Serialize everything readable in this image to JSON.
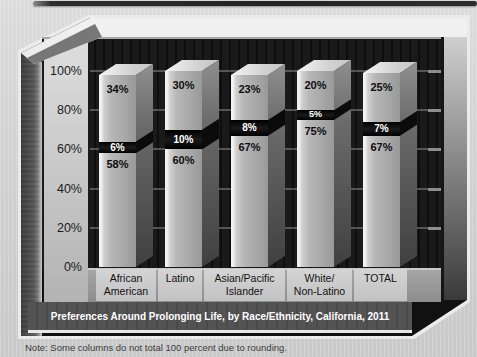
{
  "page": {
    "note": "Note: Some columns do not total 100 percent due to rounding."
  },
  "chart_data": {
    "type": "bar",
    "subtype": "stacked-3d-column",
    "title": "Preferences Around Prolonging Life, by Race/Ethnicity, California, 2011",
    "categories": [
      "African American",
      "Latino",
      "Asian/Pacific Islander",
      "White/Non-Latino",
      "TOTAL"
    ],
    "category_lines": [
      [
        "African",
        "American"
      ],
      [
        "Latino"
      ],
      [
        "Asian/Pacific",
        "Islander"
      ],
      [
        "White/",
        "Non-Latino"
      ],
      [
        "TOTAL"
      ]
    ],
    "y_axis": {
      "ticks": [
        "100%",
        "80%",
        "60%",
        "40%",
        "20%",
        "0%"
      ],
      "lim": [
        0,
        100
      ],
      "grid": true
    },
    "series": [
      {
        "name": "bottom-segment",
        "values": [
          58,
          60,
          67,
          75,
          67
        ]
      },
      {
        "name": "middle-segment",
        "values": [
          6,
          10,
          8,
          5,
          7
        ]
      },
      {
        "name": "top-segment",
        "values": [
          34,
          30,
          23,
          20,
          25
        ]
      }
    ],
    "bars": [
      {
        "category": "African American",
        "top": {
          "value": 34,
          "label": "34%"
        },
        "middle": {
          "value": 6,
          "label": "6%"
        },
        "bottom": {
          "value": 58,
          "label": "58%"
        }
      },
      {
        "category": "Latino",
        "top": {
          "value": 30,
          "label": "30%"
        },
        "middle": {
          "value": 10,
          "label": "10%"
        },
        "bottom": {
          "value": 60,
          "label": "60%"
        }
      },
      {
        "category": "Asian/Pacific Islander",
        "top": {
          "value": 23,
          "label": "23%"
        },
        "middle": {
          "value": 8,
          "label": "8%"
        },
        "bottom": {
          "value": 67,
          "label": "67%"
        }
      },
      {
        "category": "White/Non-Latino",
        "top": {
          "value": 20,
          "label": "20%"
        },
        "middle": {
          "value": 5,
          "label": "5%"
        },
        "bottom": {
          "value": 75,
          "label": "75%"
        }
      },
      {
        "category": "TOTAL",
        "top": {
          "value": 25,
          "label": "25%"
        },
        "middle": {
          "value": 7,
          "label": "7%"
        },
        "bottom": {
          "value": 67,
          "label": "67%"
        }
      }
    ],
    "legend": false
  },
  "colors": {
    "background": "#d2d2d2",
    "plot_wall": "#0e0e0e",
    "bar_face": "#b0b0b0",
    "bar_black_band": "#0b0b0b",
    "axis_panel": "#c9c9c9",
    "title_band": "#4a4a4a",
    "title_text": "#ffffff",
    "label_text": "#111111",
    "outline": "#ebebeb"
  }
}
